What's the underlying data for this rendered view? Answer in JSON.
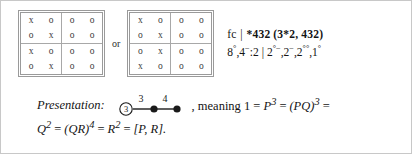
{
  "matrices": [
    {
      "name": "matrix-left",
      "rows": [
        [
          "x",
          "o",
          "o",
          "o"
        ],
        [
          "o",
          "x",
          "o",
          "o"
        ],
        [
          "x",
          "o",
          "o",
          "o"
        ],
        [
          "o",
          "x",
          "o",
          "o"
        ]
      ]
    },
    {
      "name": "matrix-right",
      "rows": [
        [
          "x",
          "o",
          "o",
          "o"
        ],
        [
          "o",
          "x",
          "o",
          "o"
        ],
        [
          "o",
          "x",
          "o",
          "o"
        ],
        [
          "x",
          "o",
          "o",
          "o"
        ]
      ]
    }
  ],
  "separator": {
    "or_label": "or"
  },
  "notation": {
    "line1": {
      "prefix": "fc",
      "bar": "|",
      "group": "*432",
      "paren": "(3*2, 432)"
    },
    "line2": {
      "left_a_base": "8",
      "left_a_sup": "°",
      "left_b_base": "4",
      "left_b_sup": "−",
      "left_b_suffix": ":2",
      "bar": "|",
      "items": [
        {
          "base": "2",
          "sup": "°−"
        },
        {
          "base": "2",
          "sup": "−"
        },
        {
          "base": "2",
          "sup": "°°"
        },
        {
          "base": "1",
          "sup": "°"
        }
      ]
    }
  },
  "presentation": {
    "label": "Presentation:",
    "diagram": {
      "node1_label": "3",
      "edge1_label": "3",
      "edge2_label": "4"
    },
    "tail": ", meaning 1 = ",
    "line1_math": [
      {
        "base": "P",
        "sup": "3"
      },
      {
        "base": "(PQ)",
        "sup": "3"
      }
    ],
    "line2_math": [
      {
        "base": "Q",
        "sup": "2"
      },
      {
        "base": "(QR)",
        "sup": "4"
      },
      {
        "base": "R",
        "sup": "2"
      }
    ],
    "line2_end": "[P, R].",
    "equals": "=",
    "meaning_word": "meaning",
    "one": "1"
  }
}
